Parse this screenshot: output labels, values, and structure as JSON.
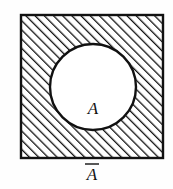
{
  "figure": {
    "kind": "venn-diagram",
    "background_color": "#fefefe",
    "ink_color": "#111111"
  },
  "universal_set": {
    "shape": "square",
    "x": 21,
    "y": 15,
    "width": 142,
    "height": 143,
    "stroke_width": 2,
    "fill": "hatched",
    "hatch": {
      "direction": "backslash",
      "angle_degrees": -45,
      "spacing_px": 6.5,
      "line_width_px": 2.6,
      "color": "#111111"
    }
  },
  "set_a": {
    "shape": "circle",
    "center_x": 93,
    "center_y": 87,
    "radius": 43,
    "stroke_width": 2,
    "fill": "#ffffff",
    "label": "A",
    "label_x": 93,
    "label_y": 114
  },
  "complement_label": {
    "text": "A",
    "accent": "overbar",
    "display": "Ā",
    "x": 92,
    "y": 180,
    "bar_x1": 85,
    "bar_x2": 99,
    "bar_y": 164
  }
}
